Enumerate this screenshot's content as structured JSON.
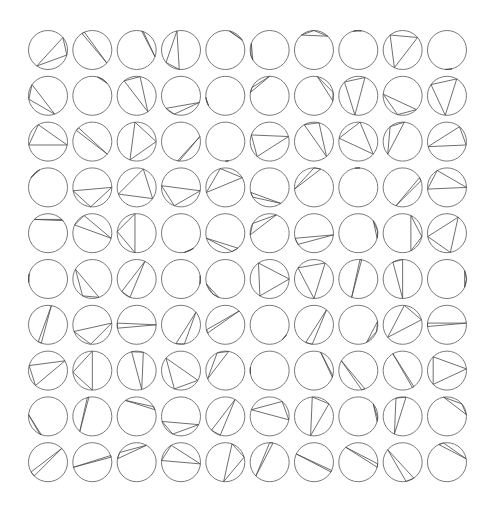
{
  "figure": {
    "rows": 10,
    "cols": 10,
    "stroke_color": "#555555",
    "background": "#ffffff"
  },
  "layout": {
    "origin_x": 48,
    "origin_y": 50,
    "pitch_x": 44.33,
    "pitch_y": 45.8,
    "radius": 19.5
  },
  "triangles_deg": [
    [
      [
        -40,
        15,
        125
      ],
      [
        238,
        246,
        42
      ],
      [
        285,
        290,
        20
      ],
      [
        258,
        140,
        95
      ],
      [
        282,
        325,
        330
      ],
      [
        200,
        150,
        165
      ],
      [
        230,
        270,
        315
      ],
      [
        255,
        265,
        280
      ],
      [
        230,
        320,
        115
      ],
      [
        75,
        85,
        95
      ]
    ],
    [
      [
        215,
        170,
        70
      ],
      [
        285,
        300,
        320
      ],
      [
        230,
        280,
        55
      ],
      [
        140,
        110,
        20
      ],
      [
        150,
        165,
        175
      ],
      [
        190,
        205,
        270
      ],
      [
        280,
        350,
        15
      ],
      [
        225,
        290,
        100
      ],
      [
        185,
        45,
        105
      ],
      [
        215,
        300,
        95
      ]
    ],
    [
      [
        240,
        170,
        10
      ],
      [
        225,
        215,
        40
      ],
      [
        265,
        110,
        0
      ],
      [
        100,
        95,
        345
      ],
      [
        80,
        85,
        90
      ],
      [
        200,
        130,
        345
      ],
      [
        240,
        285,
        50
      ],
      [
        275,
        190,
        40
      ],
      [
        230,
        275,
        140
      ],
      [
        310,
        165,
        10
      ]
    ],
    [
      [
        210,
        230,
        245
      ],
      [
        170,
        0,
        95
      ],
      [
        290,
        160,
        35
      ],
      [
        185,
        10,
        110
      ],
      [
        255,
        330,
        165
      ],
      [
        165,
        55,
        150
      ],
      [
        270,
        175,
        290
      ],
      [
        260,
        268,
        275
      ],
      [
        330,
        110,
        340
      ],
      [
        240,
        0,
        175
      ]
    ],
    [
      [
        225,
        315,
        320
      ],
      [
        245,
        205,
        15
      ],
      [
        265,
        185,
        95
      ],
      [
        60,
        80,
        50
      ],
      [
        165,
        70,
        50
      ],
      [
        290,
        210,
        175
      ],
      [
        165,
        5,
        145
      ],
      [
        320,
        355,
        15
      ],
      [
        295,
        65,
        10
      ],
      [
        305,
        170,
        80
      ]
    ],
    [
      [
        170,
        185,
        195
      ],
      [
        210,
        70,
        120
      ],
      [
        295,
        140,
        110
      ],
      [
        350,
        15,
        5
      ],
      [
        165,
        130,
        110
      ],
      [
        235,
        0,
        120
      ],
      [
        215,
        305,
        90
      ],
      [
        275,
        110,
        280
      ],
      [
        240,
        270,
        90
      ],
      [
        335,
        25,
        0
      ]
    ],
    [
      [
        280,
        120,
        110
      ],
      [
        160,
        95,
        355
      ],
      [
        185,
        170,
        0
      ],
      [
        320,
        105,
        80
      ],
      [
        315,
        165,
        155
      ],
      [
        40,
        50,
        30
      ],
      [
        310,
        115,
        95
      ],
      [
        350,
        65,
        20
      ],
      [
        275,
        345,
        140
      ],
      [
        185,
        175,
        355
      ]
    ],
    [
      [
        195,
        330,
        130
      ],
      [
        270,
        175,
        90
      ],
      [
        255,
        290,
        75
      ],
      [
        220,
        30,
        110
      ],
      [
        245,
        280,
        155
      ],
      [
        170,
        180,
        190
      ],
      [
        290,
        15,
        20
      ],
      [
        210,
        80,
        70
      ],
      [
        240,
        60,
        55
      ],
      [
        225,
        355,
        135
      ]
    ],
    [
      [
        185,
        115,
        110
      ],
      [
        255,
        260,
        130
      ],
      [
        235,
        330,
        340
      ],
      [
        165,
        25,
        115
      ],
      [
        300,
        135,
        105
      ],
      [
        200,
        310,
        10
      ],
      [
        265,
        320,
        100
      ],
      [
        320,
        15,
        5
      ],
      [
        250,
        280,
        115
      ],
      [
        260,
        320,
        355
      ]
    ],
    [
      [
        315,
        150,
        135
      ],
      [
        165,
        345,
        340
      ],
      [
        300,
        190,
        210
      ],
      [
        240,
        185,
        5
      ],
      [
        290,
        95,
        345
      ],
      [
        280,
        270,
        135
      ],
      [
        205,
        30,
        25
      ],
      [
        230,
        15,
        5
      ],
      [
        220,
        80,
        55
      ],
      [
        245,
        350,
        260
      ]
    ]
  ]
}
